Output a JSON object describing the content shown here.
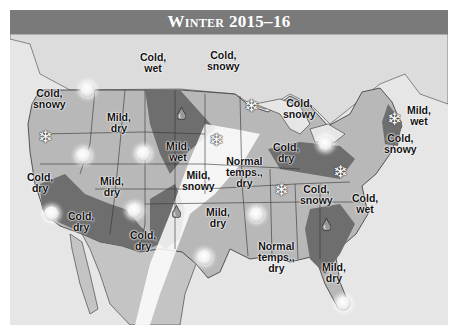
{
  "header": {
    "title": "Winter 2015–16"
  },
  "colors": {
    "title_bar": "#7a7a7a",
    "cold_region": "#6e6e6e",
    "mild_region": "#a3a3a3",
    "normal_region": "#ffffff",
    "land_base": "#b8b8b8",
    "water": "#e6e6e6"
  },
  "regions": [
    {
      "id": "pacific-nw",
      "text1": "Cold,",
      "text2": "snowy"
    },
    {
      "id": "northern-rockies",
      "text1": "Cold,",
      "text2": "wet"
    },
    {
      "id": "upper-midwest",
      "text1": "Cold,",
      "text2": "snowy"
    },
    {
      "id": "great-lakes",
      "text1": "Cold,",
      "text2": "snowy"
    },
    {
      "id": "new-england",
      "text1": "Mild,",
      "text2": "wet"
    },
    {
      "id": "idaho-montana",
      "text1": "Mild,",
      "text2": "dry"
    },
    {
      "id": "central-plains",
      "text1": "Mild,",
      "text2": "wet"
    },
    {
      "id": "ohio-valley",
      "text1": "Cold,",
      "text2": "dry"
    },
    {
      "id": "mid-atlantic",
      "text1": "Cold,",
      "text2": "snowy"
    },
    {
      "id": "california",
      "text1": "Cold,",
      "text2": "dry"
    },
    {
      "id": "great-basin",
      "text1": "Mild,",
      "text2": "dry"
    },
    {
      "id": "kansas",
      "text1": "Mild,",
      "text2": "snowy"
    },
    {
      "id": "missouri",
      "text1": "Normal",
      "text2": "temps.,",
      "text3": "dry"
    },
    {
      "id": "southwest",
      "text1": "Cold,",
      "text2": "dry"
    },
    {
      "id": "new-mexico",
      "text1": "Cold,",
      "text2": "dry"
    },
    {
      "id": "texas",
      "text1": "Mild,",
      "text2": "dry"
    },
    {
      "id": "tennessee",
      "text1": "Cold,",
      "text2": "snowy"
    },
    {
      "id": "carolinas",
      "text1": "Cold,",
      "text2": "wet"
    },
    {
      "id": "gulf-coast",
      "text1": "Normal",
      "text2": "temps.,",
      "text3": "dry"
    },
    {
      "id": "florida",
      "text1": "Mild,",
      "text2": "dry"
    }
  ],
  "icons": {
    "sun": "sun-icon",
    "snowflake": "snowflake-icon",
    "raindrop": "raindrop-icon",
    "snowflake_glyph": "❄"
  }
}
